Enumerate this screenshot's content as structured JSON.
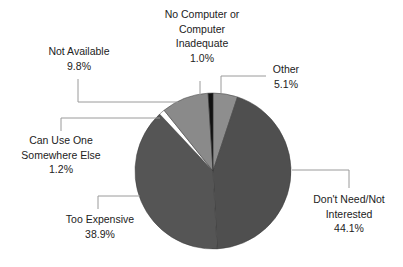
{
  "chart_data": {
    "type": "pie",
    "title": "",
    "start_angle_deg": 0,
    "direction": "clockwise",
    "slices": [
      {
        "label": "Other",
        "value": 5.1,
        "display": "5.1%",
        "color": "#8e8e8e"
      },
      {
        "label": "Don't Need/Not Interested",
        "value": 44.1,
        "display": "44.1%",
        "color": "#4f4f4f"
      },
      {
        "label": "Too Expensive",
        "value": 38.9,
        "display": "38.9%",
        "color": "#555555"
      },
      {
        "label": "Can Use One Somewhere Else",
        "value": 1.2,
        "display": "1.2%",
        "color": "#ffffff"
      },
      {
        "label": "Not Available",
        "value": 9.8,
        "display": "9.8%",
        "color": "#8a8a8a"
      },
      {
        "label": "No Computer or Computer Inadequate",
        "value": 1.0,
        "display": "1.0%",
        "color": "#111111"
      }
    ],
    "center": [
      213,
      171
    ],
    "radius": 78
  },
  "labels": {
    "other": {
      "line1": "Other",
      "line2": "5.1%"
    },
    "dont_need": {
      "line1": "Don't Need/Not",
      "line2": "Interested",
      "line3": "44.1%"
    },
    "too_expensive": {
      "line1": "Too Expensive",
      "line2": "38.9%"
    },
    "can_use": {
      "line1": "Can Use One",
      "line2": "Somewhere Else",
      "line3": "1.2%"
    },
    "not_available": {
      "line1": "Not Available",
      "line2": "9.8%"
    },
    "no_computer": {
      "line1": "No Computer or",
      "line2": "Computer",
      "line3": "Inadequate",
      "line4": "1.0%"
    }
  }
}
